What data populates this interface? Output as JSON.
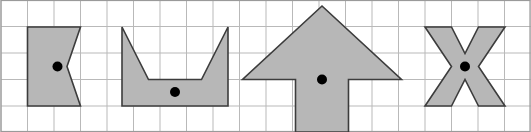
{
  "figure": {
    "width": 531,
    "height": 132,
    "background_color": "#ffffff"
  },
  "grid": {
    "name": "square-grid",
    "cell_size": 26.5,
    "columns": 20,
    "rows": 5,
    "origin_x": 1,
    "origin_y": 0,
    "line_color": "#b9b9b9",
    "line_width": 1,
    "border_color": "#9a9a9a",
    "border_width": 1.2,
    "visible": true
  },
  "style": {
    "shape_fill": "#b7b7b7",
    "shape_stroke": "#3c3c3c",
    "shape_stroke_width": 1.6,
    "dot_color": "#000000",
    "dot_radius": 5
  },
  "shapes": [
    {
      "id": "shape-1",
      "name": "bowtie-shape",
      "label": "Bowtie / concave hexagon",
      "points": "27.5,27 27.5,106 80.5,106 67,66.5 80.5,27",
      "centroid": {
        "x": 57.5,
        "y": 66.5
      }
    },
    {
      "id": "shape-2",
      "name": "cup-shape",
      "label": "Cup / open trapezoid",
      "points": "122,27 122,106 228,106 228,27 201.5,79.5 148.5,79.5",
      "centroid": {
        "x": 175,
        "y": 92
      }
    },
    {
      "id": "shape-3",
      "name": "up-arrow-shape",
      "label": "Upward arrow",
      "points": "322,6 401.5,79.5 348.5,79.5 348.5,132 295.5,132 295.5,79.5 242.5,79.5",
      "centroid": {
        "x": 322,
        "y": 79.5
      }
    },
    {
      "id": "shape-4",
      "name": "x-star-shape",
      "label": "Four-pointed X / concave octagon",
      "points": "425,27 451.5,27 465,53.5 478.5,27 505,27 478.5,66.5 505,106 478.5,106 465,79.5 451.5,106 425,106 451.5,66.5"
    }
  ],
  "centroid_markers": [
    {
      "name": "centroid-dot-1",
      "x": 57.5,
      "y": 66.5
    },
    {
      "name": "centroid-dot-2",
      "x": 175,
      "y": 92
    },
    {
      "name": "centroid-dot-3",
      "x": 322,
      "y": 79.5
    },
    {
      "name": "centroid-dot-4",
      "x": 465,
      "y": 66.5
    }
  ]
}
